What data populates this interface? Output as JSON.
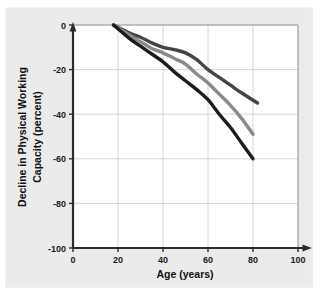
{
  "chart_data": {
    "type": "line",
    "title": "",
    "xlabel": "Age (years)",
    "ylabel": "Decline in Physical Working Capacity (percent)",
    "ylabel_line1": "Decline in Physical Working",
    "ylabel_line2": "Capacity (percent)",
    "xlim": [
      0,
      100
    ],
    "ylim": [
      -100,
      0
    ],
    "xticks": [
      0,
      20,
      40,
      60,
      80,
      100
    ],
    "yticks": [
      0,
      -20,
      -40,
      -60,
      -80,
      -100
    ],
    "xtick_labels": [
      "0",
      "20",
      "40",
      "60",
      "80",
      "100"
    ],
    "ytick_labels": [
      "0",
      "-20",
      "-40",
      "-60",
      "-80",
      "-100"
    ],
    "grid": true,
    "legend": "none",
    "series": [
      {
        "name": "upper-curve",
        "color": "#454545",
        "x": [
          18,
          25,
          30,
          35,
          40,
          45,
          50,
          55,
          60,
          65,
          70,
          75,
          82
        ],
        "y": [
          0,
          -3.5,
          -5.5,
          -8,
          -10,
          -11,
          -12.5,
          -15.5,
          -20,
          -23.5,
          -27,
          -30.5,
          -35
        ]
      },
      {
        "name": "middle-curve",
        "color": "#8a8a8a",
        "x": [
          18,
          25,
          30,
          35,
          40,
          45,
          50,
          55,
          60,
          65,
          70,
          75,
          80
        ],
        "y": [
          0,
          -4.5,
          -7.5,
          -10.5,
          -12.5,
          -15,
          -17.5,
          -22,
          -26,
          -31,
          -36,
          -42,
          -49
        ]
      },
      {
        "name": "lower-curve",
        "color": "#1c1c1c",
        "x": [
          18,
          25,
          30,
          35,
          40,
          45,
          50,
          55,
          60,
          65,
          70,
          75,
          80
        ],
        "y": [
          0,
          -6,
          -9.5,
          -13,
          -16.5,
          -21,
          -25,
          -29,
          -33.5,
          -40,
          -46,
          -53,
          -60
        ]
      }
    ]
  },
  "axes": {
    "x_title": "Age (years)",
    "y_title_line1": "Decline in Physical Working",
    "y_title_line2": "Capacity (percent)"
  },
  "colors": {
    "background": "#ebebeb",
    "plot_background": "#ffffff",
    "axis": "#333333",
    "grid": "#cccccc",
    "series_upper": "#454545",
    "series_middle": "#8a8a8a",
    "series_lower": "#1c1c1c"
  }
}
